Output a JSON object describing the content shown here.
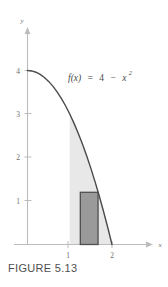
{
  "figure": {
    "caption": "FIGURE 5.13",
    "formula": {
      "lhs": "f(x)",
      "equals": "=",
      "rhs_constant": "4",
      "minus": "−",
      "rhs_var": "x",
      "rhs_exponent": "2",
      "full": "f(x) = 4 − x²"
    },
    "colors": {
      "curve": "#4a4a4a",
      "axis": "#b4b4b4",
      "region_fill": "#e8e8e8",
      "rect_fill": "#9a9a9a",
      "rect_stroke": "#4f4f4f",
      "text": "#555555",
      "background": "#ffffff"
    }
  },
  "chart_data": {
    "type": "line",
    "title": "",
    "subtitle": "",
    "xlabel": "x",
    "ylabel": "y",
    "xlim": [
      0,
      2.35
    ],
    "ylim": [
      0,
      4.6
    ],
    "grid": false,
    "legend_position": "none",
    "xticks": [
      1,
      2
    ],
    "xtick_labels": [
      "1",
      "2"
    ],
    "yticks": [
      1,
      2,
      3,
      4
    ],
    "ytick_labels": [
      "1",
      "2",
      "3",
      "4"
    ],
    "series": [
      {
        "name": "f(x) = 4 - x^2",
        "type": "line",
        "x": [
          0,
          0.1,
          0.2,
          0.3,
          0.4,
          0.5,
          0.6,
          0.7,
          0.8,
          0.9,
          1.0,
          1.1,
          1.2,
          1.3,
          1.4,
          1.5,
          1.6,
          1.7,
          1.8,
          1.9,
          2.0
        ],
        "values": [
          4,
          3.99,
          3.96,
          3.91,
          3.84,
          3.75,
          3.64,
          3.51,
          3.36,
          3.19,
          3.0,
          2.79,
          2.56,
          2.31,
          2.04,
          1.75,
          1.44,
          1.11,
          0.76,
          0.39,
          0
        ]
      }
    ],
    "annotations": [
      {
        "name": "function-formula",
        "text": "f(x) = 4 − x²",
        "x": 1.0,
        "y": 3.55
      }
    ],
    "shaded_region": {
      "name": "area-under-curve",
      "x_start": 1.0,
      "x_end": 2.0,
      "upper": "f(x) = 4 - x^2",
      "lower": 0,
      "fill": "#e8e8e8"
    },
    "rectangle": {
      "name": "inscribed-rectangle",
      "x_start": 1.25,
      "x_end": 1.67,
      "y_start": 0,
      "y_end": 1.2,
      "fill": "#9a9a9a",
      "stroke": "#4f4f4f"
    }
  }
}
